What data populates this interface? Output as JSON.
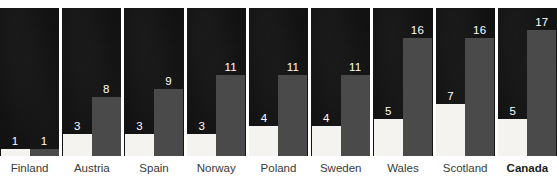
{
  "chart_data": {
    "type": "bar",
    "title": "",
    "subtitle": "",
    "xlabel": "",
    "ylabel": "",
    "ylim": [
      0,
      20
    ],
    "grid": false,
    "legend_position": "none",
    "label_position": "above-bar",
    "categories": [
      "Finland",
      "Austria",
      "Spain",
      "Norway",
      "Poland",
      "Sweden",
      "Wales",
      "Scotland",
      "Canada"
    ],
    "highlighted_category": "Canada",
    "series": [
      {
        "name": "white-bar",
        "color": "#f4f3f0",
        "values": [
          1,
          3,
          3,
          3,
          4,
          4,
          5,
          7,
          5
        ]
      },
      {
        "name": "grey-bar",
        "color": "#4a4a4a",
        "values": [
          1,
          8,
          9,
          11,
          11,
          11,
          16,
          16,
          17
        ]
      }
    ],
    "panels": [
      {
        "category": "Finland",
        "highlighted": false,
        "bars": [
          {
            "series": "white-bar",
            "value": 1,
            "label": "1"
          },
          {
            "series": "grey-bar",
            "value": 1,
            "label": "1"
          }
        ]
      },
      {
        "category": "Austria",
        "highlighted": false,
        "bars": [
          {
            "series": "white-bar",
            "value": 3,
            "label": "3"
          },
          {
            "series": "grey-bar",
            "value": 8,
            "label": "8"
          }
        ]
      },
      {
        "category": "Spain",
        "highlighted": false,
        "bars": [
          {
            "series": "white-bar",
            "value": 3,
            "label": "3"
          },
          {
            "series": "grey-bar",
            "value": 9,
            "label": "9"
          }
        ]
      },
      {
        "category": "Norway",
        "highlighted": false,
        "bars": [
          {
            "series": "white-bar",
            "value": 3,
            "label": "3"
          },
          {
            "series": "grey-bar",
            "value": 11,
            "label": "11"
          }
        ]
      },
      {
        "category": "Poland",
        "highlighted": false,
        "bars": [
          {
            "series": "white-bar",
            "value": 4,
            "label": "4"
          },
          {
            "series": "grey-bar",
            "value": 11,
            "label": "11"
          }
        ]
      },
      {
        "category": "Sweden",
        "highlighted": false,
        "bars": [
          {
            "series": "white-bar",
            "value": 4,
            "label": "4"
          },
          {
            "series": "grey-bar",
            "value": 11,
            "label": "11"
          }
        ]
      },
      {
        "category": "Wales",
        "highlighted": false,
        "bars": [
          {
            "series": "white-bar",
            "value": 5,
            "label": "5"
          },
          {
            "series": "grey-bar",
            "value": 16,
            "label": "16"
          }
        ]
      },
      {
        "category": "Scotland",
        "highlighted": false,
        "bars": [
          {
            "series": "white-bar",
            "value": 7,
            "label": "7"
          },
          {
            "series": "grey-bar",
            "value": 16,
            "label": "16"
          }
        ]
      },
      {
        "category": "Canada",
        "highlighted": true,
        "bars": [
          {
            "series": "white-bar",
            "value": 5,
            "label": "5"
          },
          {
            "series": "grey-bar",
            "value": 17,
            "label": "17"
          }
        ]
      }
    ]
  },
  "colors": {
    "panel_background": "#121212",
    "white_bar": "#f4f3f0",
    "grey_bar": "#4a4a4a",
    "value_text": "#ffffff",
    "label_text": "#3a3a3a",
    "label_text_highlight": "#1d1d1d",
    "page_background": "#ffffff"
  },
  "render": {
    "panel_top_px": 8,
    "panel_height_px": 148,
    "value_scale_max": 20,
    "bar_width_px": 29
  }
}
